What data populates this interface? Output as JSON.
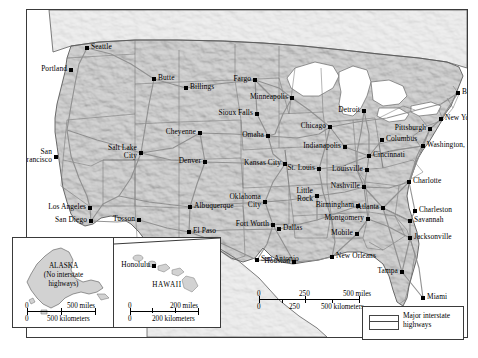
{
  "map": {
    "title": "Major interstate highways of the United States",
    "background_color": "#ffffff",
    "land_color": "#c6c6c6",
    "neighbor_land_color": "#e8e8e8",
    "water_color": "#ffffff",
    "border_color": "#3a3a3a",
    "highway_color": "#8c8c8c",
    "state_border_color": "#6e6e6e",
    "label_color": "#000000"
  },
  "cities": [
    {
      "name": "Seattle",
      "x": 60,
      "y": 38,
      "side": "r",
      "lines": 1
    },
    {
      "name": "Portland",
      "x": 44,
      "y": 60,
      "side": "l",
      "lines": 1
    },
    {
      "name": "Butte",
      "x": 127,
      "y": 69,
      "side": "r",
      "lines": 1
    },
    {
      "name": "Billings",
      "x": 159,
      "y": 78,
      "side": "r",
      "lines": 1
    },
    {
      "name": "Fargo",
      "x": 228,
      "y": 70,
      "side": "l",
      "lines": 1
    },
    {
      "name": "Minneapolis",
      "x": 265,
      "y": 88,
      "side": "l",
      "lines": 1
    },
    {
      "name": "Sioux Falls",
      "x": 230,
      "y": 104,
      "side": "l",
      "lines": 1
    },
    {
      "name": "Cheyenne",
      "x": 173,
      "y": 123,
      "side": "l",
      "lines": 1
    },
    {
      "name": "Omaha",
      "x": 241,
      "y": 126,
      "side": "l",
      "lines": 1
    },
    {
      "name": "Chicago",
      "x": 303,
      "y": 117,
      "side": "l",
      "lines": 1
    },
    {
      "name": "Detroit",
      "x": 337,
      "y": 101,
      "side": "l",
      "lines": 1
    },
    {
      "name": "Boston",
      "x": 431,
      "y": 83,
      "side": "r",
      "lines": 1
    },
    {
      "name": "New York",
      "x": 414,
      "y": 109,
      "side": "r",
      "lines": 1
    },
    {
      "name": "Pittsburgh",
      "x": 403,
      "y": 119,
      "side": "l",
      "lines": 1
    },
    {
      "name": "Columbus",
      "x": 355,
      "y": 130,
      "side": "r",
      "lines": 1
    },
    {
      "name": "Washington, D.C.",
      "x": 396,
      "y": 136,
      "side": "r",
      "lines": 1
    },
    {
      "name": "Indianapolis",
      "x": 318,
      "y": 137,
      "side": "l",
      "lines": 1
    },
    {
      "name": "Cincinnati",
      "x": 342,
      "y": 146,
      "side": "r",
      "lines": 1
    },
    {
      "name": "Salt Lake City",
      "x": 114,
      "y": 143,
      "side": "l",
      "lines": 2
    },
    {
      "name": "San Francisco",
      "x": 29,
      "y": 147,
      "side": "l",
      "lines": 2
    },
    {
      "name": "Denver",
      "x": 178,
      "y": 152,
      "side": "l",
      "lines": 1
    },
    {
      "name": "Kansas City",
      "x": 258,
      "y": 154,
      "side": "l",
      "lines": 1
    },
    {
      "name": "St. Louis",
      "x": 292,
      "y": 159,
      "side": "l",
      "lines": 1
    },
    {
      "name": "Louisville",
      "x": 340,
      "y": 160,
      "side": "l",
      "lines": 1
    },
    {
      "name": "Charlotte",
      "x": 382,
      "y": 172,
      "side": "r",
      "lines": 1
    },
    {
      "name": "Nashville",
      "x": 337,
      "y": 177,
      "side": "l",
      "lines": 1
    },
    {
      "name": "Little Rock",
      "x": 290,
      "y": 186,
      "side": "l",
      "lines": 2
    },
    {
      "name": "Los Angeles",
      "x": 63,
      "y": 198,
      "side": "l",
      "lines": 1
    },
    {
      "name": "Oklahoma City",
      "x": 238,
      "y": 192,
      "side": "l",
      "lines": 2
    },
    {
      "name": "Albuquerque",
      "x": 163,
      "y": 197,
      "side": "r",
      "lines": 1
    },
    {
      "name": "Birmingham",
      "x": 331,
      "y": 196,
      "side": "l",
      "lines": 1
    },
    {
      "name": "Atlanta",
      "x": 356,
      "y": 198,
      "side": "l",
      "lines": 1
    },
    {
      "name": "Charleston",
      "x": 388,
      "y": 201,
      "side": "r",
      "lines": 1
    },
    {
      "name": "San Diego",
      "x": 64,
      "y": 211,
      "side": "l",
      "lines": 1
    },
    {
      "name": "Tucson",
      "x": 112,
      "y": 210,
      "side": "l",
      "lines": 1
    },
    {
      "name": "Montgomery",
      "x": 341,
      "y": 209,
      "side": "l",
      "lines": 1
    },
    {
      "name": "Savannah",
      "x": 383,
      "y": 211,
      "side": "r",
      "lines": 1
    },
    {
      "name": "Fort Worth",
      "x": 246,
      "y": 215,
      "side": "l",
      "lines": 1
    },
    {
      "name": "Dallas",
      "x": 252,
      "y": 219,
      "side": "r",
      "lines": 1
    },
    {
      "name": "El Paso",
      "x": 162,
      "y": 222,
      "side": "r",
      "lines": 1
    },
    {
      "name": "Mobile",
      "x": 330,
      "y": 224,
      "side": "l",
      "lines": 1
    },
    {
      "name": "Jacksonville",
      "x": 383,
      "y": 228,
      "side": "r",
      "lines": 1
    },
    {
      "name": "San Antonio",
      "x": 230,
      "y": 250,
      "side": "r",
      "lines": 1
    },
    {
      "name": "Houston",
      "x": 267,
      "y": 252,
      "side": "l",
      "lines": 1
    },
    {
      "name": "New Orleans",
      "x": 305,
      "y": 247,
      "side": "r",
      "lines": 1
    },
    {
      "name": "Tampa",
      "x": 375,
      "y": 262,
      "side": "l",
      "lines": 1
    },
    {
      "name": "Miami",
      "x": 396,
      "y": 288,
      "side": "r",
      "lines": 1
    }
  ],
  "insets": [
    {
      "id": "alaska",
      "title_lines": [
        "ALASKA",
        "(No interstate",
        "highways)"
      ],
      "scale": {
        "miles_labels": [
          "0",
          "500 miles"
        ],
        "km_labels": [
          "0",
          "500 kilometers"
        ]
      }
    },
    {
      "id": "hawaii",
      "title_lines": [
        "HAWAII"
      ],
      "city": "Honolulu",
      "scale": {
        "miles_labels": [
          "0",
          "200 miles"
        ],
        "km_labels": [
          "0",
          "200 kilometers"
        ]
      }
    }
  ],
  "main_scale": {
    "miles_labels": [
      "0",
      "250",
      "500 miles"
    ],
    "km_labels": [
      "0",
      "250",
      "500 kilometers"
    ]
  },
  "legend": {
    "symbol": "double-line-highway-symbol",
    "label_lines": [
      "Major interstate",
      "highways"
    ]
  },
  "caption": ""
}
